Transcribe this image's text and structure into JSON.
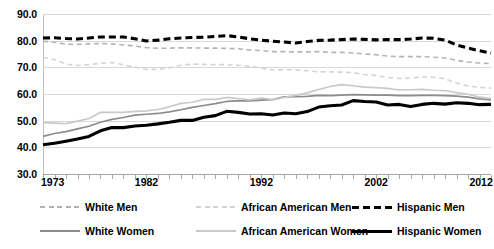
{
  "chart_data": {
    "type": "line",
    "title": "",
    "xlabel": "",
    "ylabel": "",
    "xlim": [
      1973,
      2012
    ],
    "ylim": [
      30.0,
      90.0
    ],
    "ytick_labels": [
      "90.0",
      "80.0",
      "70.0",
      "60.0",
      "50.0",
      "40.0",
      "30.0"
    ],
    "ytick_values": [
      90,
      80,
      70,
      60,
      50,
      40,
      30
    ],
    "xtick_labels": [
      "1973",
      "1982",
      "1992",
      "2002",
      "2012"
    ],
    "xtick_values": [
      1973,
      1982,
      1992,
      2002,
      2012
    ],
    "grid": true,
    "legend_position": "bottom",
    "x": [
      1973,
      1974,
      1975,
      1976,
      1977,
      1978,
      1979,
      1980,
      1981,
      1982,
      1983,
      1984,
      1985,
      1986,
      1987,
      1988,
      1989,
      1990,
      1991,
      1992,
      1993,
      1994,
      1995,
      1996,
      1997,
      1998,
      1999,
      2000,
      2001,
      2002,
      2003,
      2004,
      2005,
      2006,
      2007,
      2008,
      2009,
      2010,
      2011,
      2012
    ],
    "series": [
      {
        "name": "White Men",
        "style": "dashed",
        "color": "#b3b3b3",
        "width": 1.6,
        "values": [
          79.8,
          79.4,
          78.7,
          78.6,
          78.8,
          78.9,
          78.8,
          78.4,
          78.0,
          77.4,
          77.1,
          77.2,
          77.3,
          77.3,
          77.2,
          77.2,
          77.1,
          77.0,
          76.5,
          76.3,
          75.9,
          75.9,
          75.8,
          75.8,
          75.9,
          75.6,
          75.6,
          75.4,
          75.0,
          74.7,
          74.2,
          74.0,
          74.0,
          74.0,
          73.8,
          73.5,
          72.6,
          72.0,
          71.6,
          71.4
        ]
      },
      {
        "name": "African American Men",
        "style": "dashed",
        "color": "#d4d4d4",
        "width": 1.6,
        "values": [
          73.8,
          72.9,
          71.2,
          70.7,
          71.0,
          71.5,
          71.8,
          70.9,
          70.1,
          69.2,
          69.3,
          69.8,
          70.8,
          71.2,
          71.1,
          71.0,
          71.0,
          70.8,
          70.4,
          69.7,
          69.0,
          69.1,
          69.0,
          68.7,
          68.3,
          68.3,
          68.2,
          68.0,
          67.3,
          66.9,
          66.2,
          65.8,
          66.0,
          66.4,
          66.3,
          65.7,
          64.1,
          63.0,
          62.5,
          62.2
        ]
      },
      {
        "name": "Hispanic Men",
        "style": "dashed",
        "color": "#000000",
        "width": 3.1,
        "values": [
          81.0,
          81.1,
          80.8,
          80.6,
          81.0,
          81.4,
          81.4,
          81.4,
          80.7,
          79.9,
          80.2,
          80.7,
          81.0,
          81.2,
          81.3,
          81.6,
          81.9,
          81.4,
          80.7,
          80.2,
          79.8,
          79.5,
          79.1,
          79.7,
          80.1,
          80.2,
          80.4,
          80.6,
          80.5,
          80.3,
          80.4,
          80.4,
          80.6,
          81.0,
          80.9,
          80.2,
          78.4,
          77.2,
          76.2,
          75.3
        ]
      },
      {
        "name": "White Women",
        "style": "solid",
        "color": "#8c8c8c",
        "width": 1.7,
        "values": [
          44.1,
          45.2,
          45.9,
          46.9,
          47.9,
          49.4,
          50.5,
          51.2,
          52.1,
          52.4,
          52.7,
          53.3,
          54.1,
          55.0,
          55.7,
          56.4,
          57.2,
          57.4,
          57.4,
          57.7,
          57.9,
          58.9,
          59.0,
          59.1,
          59.5,
          59.4,
          59.6,
          59.8,
          59.7,
          59.6,
          59.6,
          59.4,
          59.4,
          59.5,
          59.5,
          59.4,
          59.2,
          58.8,
          58.2,
          57.8
        ]
      },
      {
        "name": "African American Women",
        "style": "solid",
        "color": "#c9c9c9",
        "width": 1.7,
        "values": [
          49.3,
          49.1,
          48.9,
          49.8,
          50.8,
          53.1,
          53.1,
          53.1,
          53.5,
          53.7,
          54.2,
          55.2,
          56.5,
          56.9,
          58.0,
          58.0,
          58.7,
          58.3,
          57.8,
          58.5,
          57.9,
          58.7,
          59.5,
          60.4,
          61.7,
          62.8,
          63.5,
          63.1,
          62.6,
          62.4,
          62.1,
          61.5,
          61.6,
          61.7,
          61.4,
          61.3,
          60.5,
          59.9,
          58.8,
          58.3
        ]
      },
      {
        "name": "Hispanic Women",
        "style": "solid",
        "color": "#000000",
        "width": 3.1,
        "values": [
          41.0,
          41.5,
          42.3,
          43.1,
          44.1,
          46.2,
          47.4,
          47.4,
          48.0,
          48.3,
          48.8,
          49.4,
          50.1,
          50.1,
          51.3,
          51.9,
          53.5,
          53.1,
          52.5,
          52.6,
          52.1,
          52.9,
          52.6,
          53.4,
          55.1,
          55.6,
          55.9,
          57.5,
          57.2,
          57.0,
          55.9,
          56.1,
          55.3,
          56.1,
          56.5,
          56.2,
          56.7,
          56.5,
          56.0,
          56.1
        ]
      }
    ]
  },
  "axes": {
    "ytick_labels": [
      "90.0",
      "80.0",
      "70.0",
      "60.0",
      "50.0",
      "40.0",
      "30.0"
    ],
    "xtick_labels": [
      "1973",
      "1982",
      "1992",
      "2002",
      "2012"
    ]
  },
  "legend": {
    "rows": [
      [
        {
          "label": "White Men",
          "style": "dashed",
          "color": "#b3b3b3",
          "width": 1.6
        },
        {
          "label": "African American Men",
          "style": "dashed",
          "color": "#d4d4d4",
          "width": 1.6
        },
        {
          "label": "Hispanic Men",
          "style": "dashed",
          "color": "#000000",
          "width": 3.1
        }
      ],
      [
        {
          "label": "White Women",
          "style": "solid",
          "color": "#8c8c8c",
          "width": 1.7
        },
        {
          "label": "African American Women",
          "style": "solid",
          "color": "#c9c9c9",
          "width": 1.7
        },
        {
          "label": "Hispanic Women",
          "style": "solid",
          "color": "#000000",
          "width": 3.1
        }
      ]
    ]
  },
  "colors": {
    "gridline": "#d9d9d9",
    "axis": "#a6a6a6",
    "background": "#ffffff"
  }
}
